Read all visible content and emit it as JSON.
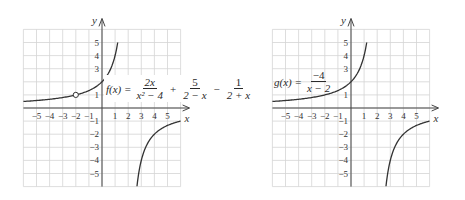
{
  "chart_data": [
    {
      "type": "line",
      "title": "f(x) = 2x/(x^2 - 4) + 5/(2 - x) - 1/(2 + x)",
      "formula": {
        "lhs": "f(x) =",
        "terms": [
          {
            "num": "2x",
            "den": "x² − 4",
            "sign": ""
          },
          {
            "num": "5",
            "den": "2 − x",
            "sign": "+"
          },
          {
            "num": "1",
            "den": "2 + x",
            "sign": "−"
          }
        ]
      },
      "xlabel": "x",
      "ylabel": "y",
      "xlim": [
        -6,
        6
      ],
      "ylim": [
        -6,
        6
      ],
      "grid": true,
      "x_ticks": [
        "−5",
        "−4",
        "−3",
        "−2",
        "−1",
        "1",
        "2",
        "3",
        "4",
        "5"
      ],
      "y_ticks": [
        "5",
        "4",
        "3",
        "2",
        "1",
        "−1",
        "−2",
        "−3",
        "−4",
        "−5"
      ],
      "vertical_asymptote": 2,
      "horizontal_asymptote": 0,
      "hole": {
        "x": -2,
        "y": 1
      },
      "series": [
        {
          "name": "left branch",
          "x": [
            -6,
            -5,
            -4,
            -3,
            -2,
            -1,
            0,
            1,
            1.2
          ],
          "y": [
            0.5,
            0.57,
            0.67,
            0.8,
            1,
            1.33,
            2,
            4,
            5
          ]
        },
        {
          "name": "right branch",
          "x": [
            2.7,
            3,
            4,
            5,
            6
          ],
          "y": [
            -5.7,
            -4,
            -2,
            -1.33,
            -1
          ]
        }
      ]
    },
    {
      "type": "line",
      "title": "g(x) = -4/(x - 2)",
      "formula": {
        "lhs": "g(x) =",
        "terms": [
          {
            "num": "−4",
            "den": "x − 2",
            "sign": ""
          }
        ]
      },
      "xlabel": "x",
      "ylabel": "y",
      "xlim": [
        -6,
        6
      ],
      "ylim": [
        -6,
        6
      ],
      "grid": true,
      "x_ticks": [
        "−5",
        "−4",
        "−3",
        "−2",
        "−1",
        "1",
        "2",
        "3",
        "4",
        "5"
      ],
      "y_ticks": [
        "5",
        "4",
        "3",
        "2",
        "1",
        "−1",
        "−2",
        "−3",
        "−4",
        "−5"
      ],
      "vertical_asymptote": 2,
      "horizontal_asymptote": 0,
      "series": [
        {
          "name": "left branch",
          "x": [
            -6,
            -5,
            -4,
            -3,
            -2,
            -1,
            0,
            1,
            1.2
          ],
          "y": [
            0.5,
            0.57,
            0.67,
            0.8,
            1,
            1.33,
            2,
            4,
            5
          ]
        },
        {
          "name": "right branch",
          "x": [
            2.7,
            3,
            4,
            5,
            6
          ],
          "y": [
            -5.7,
            -4,
            -2,
            -1.33,
            -1
          ]
        }
      ]
    }
  ]
}
